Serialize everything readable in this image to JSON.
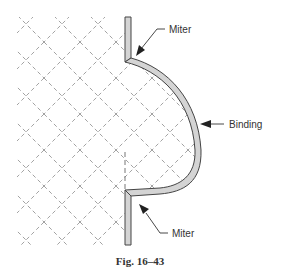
{
  "figure": {
    "caption": "Fig. 16–43",
    "labels": {
      "miter_top": "Miter",
      "binding": "Binding",
      "miter_bottom": "Miter"
    },
    "colors": {
      "binding_fill": "#d4d4d4",
      "outline": "#444444",
      "hatch": "#8a8a8a",
      "text": "#333333"
    }
  }
}
